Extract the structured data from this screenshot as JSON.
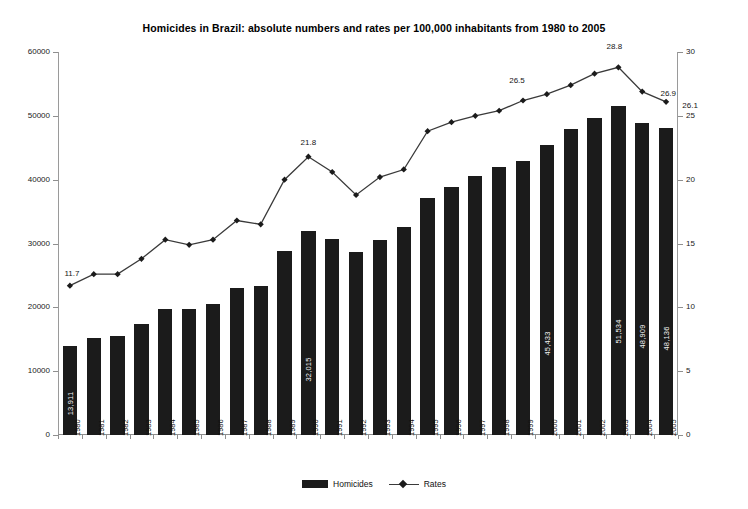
{
  "chart_data": {
    "type": "bar",
    "title": "Homicides in Brazil: absolute numbers and rates per 100,000 inhabitants from 1980 to 2005",
    "xlabel": "",
    "ylabel": "",
    "y2label": "",
    "grid": false,
    "legend_position": "bottom-center",
    "categories": [
      "1980",
      "1981",
      "1982",
      "1983",
      "1984",
      "1985",
      "1986",
      "1987",
      "1988",
      "1989",
      "1990",
      "1991",
      "1992",
      "1993",
      "1994",
      "1995",
      "1996",
      "1997",
      "1998",
      "1999",
      "2000",
      "2001",
      "2002",
      "2003",
      "2004",
      "2005"
    ],
    "ylim": [
      0,
      60000
    ],
    "yticks": [
      "0",
      "10000",
      "20000",
      "30000",
      "40000",
      "50000",
      "60000"
    ],
    "y2lim": [
      0,
      30
    ],
    "y2ticks": [
      "0",
      "5",
      "10",
      "15",
      "20",
      "25",
      "30"
    ],
    "series": [
      {
        "name": "Homicides",
        "type": "bar",
        "axis": "left",
        "color": "#1b1b1b",
        "values": [
          13911,
          15213,
          15550,
          17408,
          19767,
          19747,
          20481,
          23087,
          23357,
          28757,
          32015,
          30750,
          28649,
          30586,
          32603,
          37129,
          38888,
          40507,
          41950,
          42914,
          45433,
          47943,
          49695,
          51534,
          48909,
          48136
        ],
        "point_labels": {
          "1980": "13,911",
          "1990": "32,015",
          "2000": "45,433",
          "2003": "51,534",
          "2004": "48,909",
          "2005": "48,136"
        }
      },
      {
        "name": "Rates",
        "type": "line",
        "axis": "right",
        "color": "#3a3a3a",
        "marker": "diamond",
        "values": [
          11.7,
          12.6,
          12.6,
          13.8,
          15.3,
          14.9,
          15.3,
          16.8,
          16.5,
          20.0,
          21.8,
          20.6,
          18.8,
          20.2,
          20.8,
          23.8,
          24.5,
          25.0,
          25.4,
          26.2,
          26.7,
          27.4,
          28.3,
          28.8,
          26.9,
          26.1
        ],
        "point_labels": {
          "1980": "11.7",
          "1990": "21.8",
          "1999": "26.5",
          "2003": "28.8",
          "2004": "26.9",
          "2005": "26.1"
        }
      }
    ],
    "legend": [
      "Homicides",
      "Rates"
    ]
  },
  "legend": {
    "items": [
      {
        "label": "Homicides",
        "icon": "bar-swatch"
      },
      {
        "label": "Rates",
        "icon": "line-marker-swatch"
      }
    ]
  }
}
